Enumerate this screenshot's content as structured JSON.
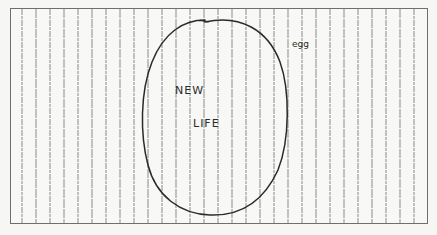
{
  "sketch": {
    "title_words": [
      "NEW",
      "LIFE"
    ],
    "label_new": "NEW",
    "label_life": "LIFE",
    "annotation": "egg"
  },
  "colors": {
    "paper": "#f8f8f6",
    "background": "#f6f6f4",
    "border": "#6e6e6e",
    "ruled_line": "#8a8a8a",
    "ink": "#2a2a2a"
  },
  "ruled_lines": {
    "start_x": 22,
    "spacing": 14,
    "count": 29,
    "top_y": 9,
    "bottom_y": 223
  },
  "egg_shape": {
    "cx": 214,
    "cy": 116,
    "rx": 72,
    "ry": 99
  }
}
